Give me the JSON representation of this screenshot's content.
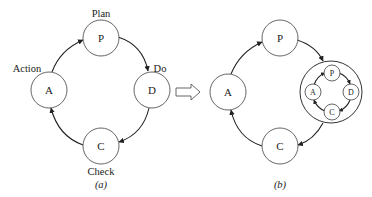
{
  "diagram_a": {
    "nodes": {
      "plan": {
        "letter": "P",
        "label": "Plan"
      },
      "do": {
        "letter": "D",
        "label": "Do"
      },
      "check": {
        "letter": "C",
        "label": "Check"
      },
      "action": {
        "letter": "A",
        "label": "Action"
      }
    },
    "caption": "(a)"
  },
  "transform_arrow": {
    "icon": "hollow-right-arrow"
  },
  "diagram_b": {
    "nodes": {
      "plan": {
        "letter": "P"
      },
      "action": {
        "letter": "A"
      },
      "check": {
        "letter": "C"
      }
    },
    "nested_cycle": {
      "plan": {
        "letter": "P"
      },
      "do": {
        "letter": "D"
      },
      "check": {
        "letter": "C"
      },
      "action": {
        "letter": "A"
      }
    },
    "caption": "(b)"
  },
  "colors": {
    "stroke": "#555555",
    "text": "#222222",
    "background": "#ffffff"
  }
}
